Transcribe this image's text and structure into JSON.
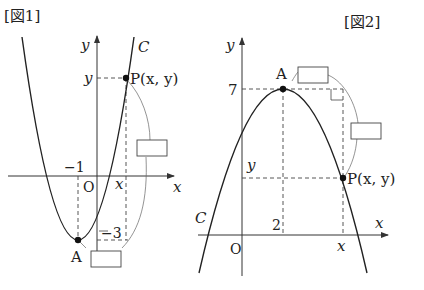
{
  "figure1": {
    "title": "[図1]",
    "curve_label": "C",
    "axis_x_label": "x",
    "axis_y_label": "y",
    "origin_label": "O",
    "vertex_label": "A",
    "vertex_x_tick": "−1",
    "vertex_y_tick": "−3",
    "point_label": "P(x, y)",
    "point_x_tick": "x",
    "point_y_tick": "y",
    "answer_boxes": [
      "",
      ""
    ]
  },
  "figure2": {
    "title": "[図2]",
    "curve_label": "C",
    "axis_x_label": "x",
    "axis_y_label": "y",
    "origin_label": "O",
    "vertex_label": "A",
    "vertex_x_tick": "2",
    "vertex_y_tick": "7",
    "point_label": "P(x, y)",
    "point_x_tick": "x",
    "point_y_tick": "y",
    "answer_boxes": [
      "",
      ""
    ]
  }
}
